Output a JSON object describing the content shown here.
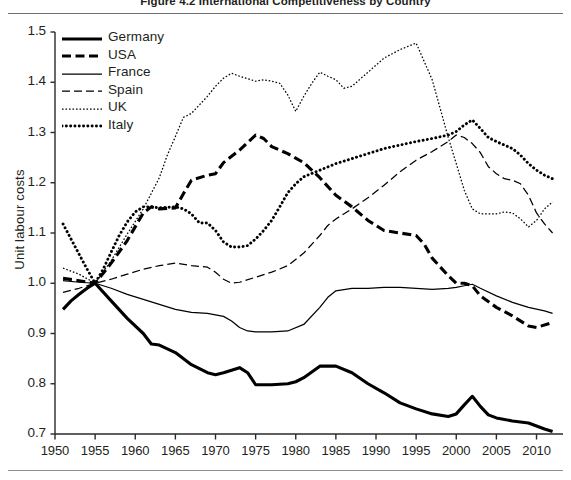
{
  "figure": {
    "title": "Figure 4.2 International Competitiveness by Country"
  },
  "chart_data": {
    "type": "line",
    "title": "Figure 4.2 International Competitiveness by Country",
    "xlabel": "",
    "ylabel": "Unit labour costs",
    "xlim": [
      1950,
      2013
    ],
    "ylim": [
      0.7,
      1.5
    ],
    "xticks": [
      1950,
      1955,
      1960,
      1965,
      1970,
      1975,
      1980,
      1985,
      1990,
      1995,
      2000,
      2005,
      2010
    ],
    "yticks": [
      0.7,
      0.8,
      0.9,
      1.0,
      1.1,
      1.2,
      1.3,
      1.4,
      1.5
    ],
    "grid": false,
    "legend_position": "top-left",
    "note": "All series are indexed to 1.0 in 1955",
    "series": [
      {
        "name": "Germany",
        "style": "solid-thick",
        "color": "#000000",
        "points": [
          [
            1951,
            0.948
          ],
          [
            1952,
            0.965
          ],
          [
            1953,
            0.978
          ],
          [
            1954,
            0.99
          ],
          [
            1955,
            1.0
          ],
          [
            1957,
            0.965
          ],
          [
            1959,
            0.93
          ],
          [
            1961,
            0.9
          ],
          [
            1962,
            0.879
          ],
          [
            1963,
            0.877
          ],
          [
            1965,
            0.862
          ],
          [
            1967,
            0.838
          ],
          [
            1969,
            0.822
          ],
          [
            1970,
            0.818
          ],
          [
            1971,
            0.822
          ],
          [
            1972,
            0.827
          ],
          [
            1973,
            0.832
          ],
          [
            1974,
            0.822
          ],
          [
            1975,
            0.798
          ],
          [
            1977,
            0.798
          ],
          [
            1979,
            0.8
          ],
          [
            1980,
            0.804
          ],
          [
            1981,
            0.812
          ],
          [
            1983,
            0.835
          ],
          [
            1985,
            0.835
          ],
          [
            1987,
            0.822
          ],
          [
            1989,
            0.8
          ],
          [
            1991,
            0.782
          ],
          [
            1993,
            0.762
          ],
          [
            1995,
            0.75
          ],
          [
            1997,
            0.74
          ],
          [
            1999,
            0.735
          ],
          [
            2000,
            0.74
          ],
          [
            2001,
            0.758
          ],
          [
            2002,
            0.775
          ],
          [
            2003,
            0.755
          ],
          [
            2004,
            0.738
          ],
          [
            2005,
            0.732
          ],
          [
            2007,
            0.726
          ],
          [
            2009,
            0.722
          ],
          [
            2010,
            0.716
          ],
          [
            2011,
            0.71
          ],
          [
            2012,
            0.705
          ]
        ]
      },
      {
        "name": "USA",
        "style": "dashed-thick",
        "color": "#000000",
        "points": [
          [
            1951,
            1.01
          ],
          [
            1953,
            1.005
          ],
          [
            1955,
            1.0
          ],
          [
            1957,
            1.04
          ],
          [
            1959,
            1.085
          ],
          [
            1961,
            1.14
          ],
          [
            1962,
            1.152
          ],
          [
            1963,
            1.148
          ],
          [
            1965,
            1.15
          ],
          [
            1966,
            1.178
          ],
          [
            1967,
            1.205
          ],
          [
            1969,
            1.215
          ],
          [
            1970,
            1.218
          ],
          [
            1971,
            1.24
          ],
          [
            1973,
            1.265
          ],
          [
            1975,
            1.295
          ],
          [
            1976,
            1.288
          ],
          [
            1977,
            1.272
          ],
          [
            1979,
            1.258
          ],
          [
            1981,
            1.24
          ],
          [
            1983,
            1.21
          ],
          [
            1985,
            1.175
          ],
          [
            1987,
            1.152
          ],
          [
            1989,
            1.125
          ],
          [
            1991,
            1.105
          ],
          [
            1993,
            1.1
          ],
          [
            1995,
            1.095
          ],
          [
            1996,
            1.078
          ],
          [
            1997,
            1.05
          ],
          [
            1999,
            1.015
          ],
          [
            2000,
            1.0
          ],
          [
            2001,
            1.0
          ],
          [
            2002,
            0.995
          ],
          [
            2003,
            0.975
          ],
          [
            2005,
            0.952
          ],
          [
            2007,
            0.935
          ],
          [
            2009,
            0.915
          ],
          [
            2010,
            0.912
          ],
          [
            2012,
            0.922
          ]
        ]
      },
      {
        "name": "France",
        "style": "solid-thin",
        "color": "#000000",
        "points": [
          [
            1951,
            1.005
          ],
          [
            1953,
            1.002
          ],
          [
            1955,
            1.0
          ],
          [
            1957,
            0.99
          ],
          [
            1959,
            0.978
          ],
          [
            1961,
            0.968
          ],
          [
            1963,
            0.958
          ],
          [
            1965,
            0.948
          ],
          [
            1967,
            0.942
          ],
          [
            1969,
            0.94
          ],
          [
            1971,
            0.934
          ],
          [
            1972,
            0.925
          ],
          [
            1973,
            0.912
          ],
          [
            1974,
            0.905
          ],
          [
            1975,
            0.903
          ],
          [
            1977,
            0.903
          ],
          [
            1979,
            0.905
          ],
          [
            1981,
            0.918
          ],
          [
            1983,
            0.952
          ],
          [
            1984,
            0.972
          ],
          [
            1985,
            0.985
          ],
          [
            1987,
            0.99
          ],
          [
            1989,
            0.99
          ],
          [
            1991,
            0.992
          ],
          [
            1993,
            0.992
          ],
          [
            1995,
            0.99
          ],
          [
            1997,
            0.988
          ],
          [
            1999,
            0.99
          ],
          [
            2000,
            0.992
          ],
          [
            2001,
            0.995
          ],
          [
            2002,
            0.998
          ],
          [
            2003,
            0.99
          ],
          [
            2005,
            0.975
          ],
          [
            2007,
            0.962
          ],
          [
            2009,
            0.952
          ],
          [
            2011,
            0.945
          ],
          [
            2012,
            0.94
          ]
        ]
      },
      {
        "name": "Spain",
        "style": "dash-dot-thin",
        "color": "#000000",
        "points": [
          [
            1951,
            0.982
          ],
          [
            1953,
            0.99
          ],
          [
            1955,
            1.0
          ],
          [
            1957,
            1.008
          ],
          [
            1959,
            1.018
          ],
          [
            1961,
            1.028
          ],
          [
            1963,
            1.035
          ],
          [
            1965,
            1.04
          ],
          [
            1967,
            1.035
          ],
          [
            1969,
            1.032
          ],
          [
            1970,
            1.022
          ],
          [
            1971,
            1.008
          ],
          [
            1972,
            1.0
          ],
          [
            1973,
            1.002
          ],
          [
            1975,
            1.012
          ],
          [
            1977,
            1.022
          ],
          [
            1979,
            1.035
          ],
          [
            1981,
            1.06
          ],
          [
            1983,
            1.095
          ],
          [
            1984,
            1.115
          ],
          [
            1985,
            1.128
          ],
          [
            1987,
            1.148
          ],
          [
            1989,
            1.17
          ],
          [
            1991,
            1.195
          ],
          [
            1993,
            1.222
          ],
          [
            1995,
            1.245
          ],
          [
            1997,
            1.262
          ],
          [
            1999,
            1.282
          ],
          [
            2000,
            1.295
          ],
          [
            2001,
            1.29
          ],
          [
            2002,
            1.278
          ],
          [
            2003,
            1.26
          ],
          [
            2004,
            1.232
          ],
          [
            2005,
            1.218
          ],
          [
            2006,
            1.208
          ],
          [
            2007,
            1.205
          ],
          [
            2008,
            1.198
          ],
          [
            2009,
            1.175
          ],
          [
            2010,
            1.14
          ],
          [
            2011,
            1.118
          ],
          [
            2012,
            1.1
          ]
        ]
      },
      {
        "name": "UK",
        "style": "dotted-fine",
        "color": "#000000",
        "points": [
          [
            1951,
            1.03
          ],
          [
            1953,
            1.018
          ],
          [
            1955,
            1.0
          ],
          [
            1957,
            1.045
          ],
          [
            1959,
            1.098
          ],
          [
            1961,
            1.148
          ],
          [
            1963,
            1.21
          ],
          [
            1964,
            1.255
          ],
          [
            1965,
            1.292
          ],
          [
            1966,
            1.33
          ],
          [
            1967,
            1.338
          ],
          [
            1969,
            1.372
          ],
          [
            1970,
            1.392
          ],
          [
            1971,
            1.408
          ],
          [
            1972,
            1.418
          ],
          [
            1973,
            1.412
          ],
          [
            1975,
            1.402
          ],
          [
            1976,
            1.405
          ],
          [
            1977,
            1.402
          ],
          [
            1978,
            1.398
          ],
          [
            1979,
            1.375
          ],
          [
            1980,
            1.342
          ],
          [
            1981,
            1.372
          ],
          [
            1982,
            1.398
          ],
          [
            1983,
            1.42
          ],
          [
            1984,
            1.412
          ],
          [
            1985,
            1.405
          ],
          [
            1986,
            1.388
          ],
          [
            1987,
            1.392
          ],
          [
            1989,
            1.42
          ],
          [
            1991,
            1.448
          ],
          [
            1993,
            1.465
          ],
          [
            1995,
            1.478
          ],
          [
            1997,
            1.405
          ],
          [
            1999,
            1.29
          ],
          [
            2000,
            1.238
          ],
          [
            2001,
            1.185
          ],
          [
            2002,
            1.148
          ],
          [
            2003,
            1.138
          ],
          [
            2005,
            1.138
          ],
          [
            2006,
            1.142
          ],
          [
            2007,
            1.14
          ],
          [
            2008,
            1.128
          ],
          [
            2009,
            1.112
          ],
          [
            2010,
            1.125
          ],
          [
            2011,
            1.148
          ],
          [
            2012,
            1.162
          ]
        ]
      },
      {
        "name": "Italy",
        "style": "dotted-bold",
        "color": "#000000",
        "points": [
          [
            1951,
            1.118
          ],
          [
            1952,
            1.088
          ],
          [
            1953,
            1.058
          ],
          [
            1954,
            1.028
          ],
          [
            1955,
            1.0
          ],
          [
            1956,
            1.028
          ],
          [
            1957,
            1.062
          ],
          [
            1958,
            1.095
          ],
          [
            1959,
            1.122
          ],
          [
            1960,
            1.142
          ],
          [
            1961,
            1.152
          ],
          [
            1962,
            1.152
          ],
          [
            1963,
            1.15
          ],
          [
            1965,
            1.152
          ],
          [
            1966,
            1.148
          ],
          [
            1967,
            1.138
          ],
          [
            1968,
            1.12
          ],
          [
            1969,
            1.12
          ],
          [
            1970,
            1.105
          ],
          [
            1971,
            1.082
          ],
          [
            1972,
            1.072
          ],
          [
            1973,
            1.072
          ],
          [
            1974,
            1.075
          ],
          [
            1975,
            1.088
          ],
          [
            1976,
            1.105
          ],
          [
            1977,
            1.125
          ],
          [
            1978,
            1.152
          ],
          [
            1979,
            1.18
          ],
          [
            1980,
            1.198
          ],
          [
            1981,
            1.212
          ],
          [
            1983,
            1.225
          ],
          [
            1985,
            1.238
          ],
          [
            1987,
            1.248
          ],
          [
            1989,
            1.258
          ],
          [
            1991,
            1.268
          ],
          [
            1993,
            1.275
          ],
          [
            1995,
            1.282
          ],
          [
            1997,
            1.288
          ],
          [
            1999,
            1.295
          ],
          [
            2000,
            1.302
          ],
          [
            2001,
            1.315
          ],
          [
            2002,
            1.325
          ],
          [
            2003,
            1.308
          ],
          [
            2004,
            1.29
          ],
          [
            2005,
            1.282
          ],
          [
            2006,
            1.275
          ],
          [
            2007,
            1.268
          ],
          [
            2008,
            1.255
          ],
          [
            2009,
            1.238
          ],
          [
            2010,
            1.225
          ],
          [
            2011,
            1.215
          ],
          [
            2012,
            1.208
          ]
        ]
      }
    ]
  },
  "axis": {
    "ylabel": "Unit labour costs",
    "yticks": [
      "1.5",
      "1.4",
      "1.3",
      "1.2",
      "1.1",
      "1.0",
      "0.9",
      "0.8",
      "0.7"
    ],
    "xticks": [
      "1950",
      "1955",
      "1960",
      "1965",
      "1970",
      "1975",
      "1980",
      "1985",
      "1990",
      "1995",
      "2000",
      "2005",
      "2010"
    ]
  },
  "legend": {
    "items": [
      {
        "label": "Germany",
        "style": "solid-thick"
      },
      {
        "label": "USA",
        "style": "dashed-thick"
      },
      {
        "label": "France",
        "style": "solid-thin"
      },
      {
        "label": "Spain",
        "style": "dash-dot-thin"
      },
      {
        "label": "UK",
        "style": "dotted-fine"
      },
      {
        "label": "Italy",
        "style": "dotted-bold"
      }
    ]
  }
}
